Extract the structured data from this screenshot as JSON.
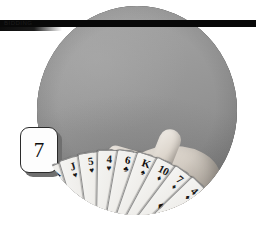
{
  "figure": {
    "label": "7",
    "caption_rule_text": "BIDDING",
    "photo_subject": "hand-holding-fanned-bridge-cards"
  },
  "badge": {
    "number": "7"
  },
  "hand_of_cards": {
    "count": 13,
    "cards": [
      {
        "rank": "Q",
        "suit": "♠",
        "suit_name": "spades"
      },
      {
        "rank": "6",
        "suit": "♠",
        "suit_name": "spades"
      },
      {
        "rank": "3",
        "suit": "♠",
        "suit_name": "spades"
      },
      {
        "rank": "2",
        "suit": "♠",
        "suit_name": "spades"
      },
      {
        "rank": "A",
        "suit": "♠",
        "suit_name": "spades"
      },
      {
        "rank": "J",
        "suit": "♥",
        "suit_name": "hearts"
      },
      {
        "rank": "5",
        "suit": "♥",
        "suit_name": "hearts"
      },
      {
        "rank": "4",
        "suit": "♥",
        "suit_name": "hearts"
      },
      {
        "rank": "6",
        "suit": "♣",
        "suit_name": "clubs"
      },
      {
        "rank": "K",
        "suit": "♠",
        "suit_name": "spades"
      },
      {
        "rank": "10",
        "suit": "♦",
        "suit_name": "diamonds"
      },
      {
        "rank": "7",
        "suit": "♦",
        "suit_name": "diamonds"
      },
      {
        "rank": "4",
        "suit": "♦",
        "suit_name": "diamonds"
      }
    ]
  },
  "colors": {
    "page_background": "#ffffff",
    "rule": "#080808",
    "photo_background": "#9a9a9a",
    "badge_background": "#fdfdfd",
    "badge_border": "#2a2a2a",
    "badge_shadow": "#6f6f6f",
    "card_face": "#f1efeb",
    "ink": "#111111"
  }
}
